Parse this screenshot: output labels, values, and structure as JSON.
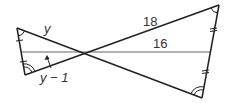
{
  "diagram": {
    "type": "two triangles sharing a vertex (bowtie) with a horizontal segment",
    "labels": {
      "left_top_side": "y",
      "left_bottom_side": "y − 1",
      "right_top_side": "18",
      "horizontal_segment": "16"
    },
    "colors": {
      "stroke": "#222222",
      "horizontal_line": "#999999",
      "text": "#333333"
    }
  }
}
